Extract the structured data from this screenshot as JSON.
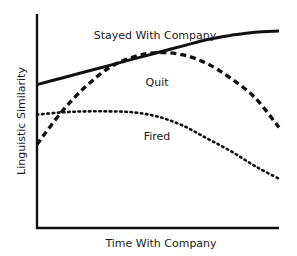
{
  "chart_data": {
    "type": "line",
    "title": "",
    "xlabel": "Time With Company",
    "ylabel": "Linguistic Similarity",
    "x_ticks": [],
    "y_ticks": [],
    "grid": false,
    "legend": "inline labels",
    "xlim": [
      0,
      1
    ],
    "ylim": [
      0,
      1
    ],
    "x": [
      0,
      0.1,
      0.2,
      0.3,
      0.4,
      0.5,
      0.6,
      0.7,
      0.8,
      0.9,
      1.0
    ],
    "series": [
      {
        "name": "Stayed With Company",
        "style": "solid",
        "color": "#111111",
        "values": [
          0.67,
          0.7,
          0.73,
          0.76,
          0.79,
          0.82,
          0.85,
          0.88,
          0.9,
          0.915,
          0.92
        ],
        "label_pos": [
          0.43,
          0.92
        ]
      },
      {
        "name": "Quit",
        "style": "dashed",
        "color": "#111111",
        "values": [
          0.39,
          0.54,
          0.66,
          0.75,
          0.8,
          0.82,
          0.81,
          0.77,
          0.7,
          0.61,
          0.47
        ],
        "label_pos": [
          0.54,
          0.7
        ]
      },
      {
        "name": "Fired",
        "style": "dotted",
        "color": "#111111",
        "values": [
          0.53,
          0.54,
          0.545,
          0.545,
          0.54,
          0.52,
          0.48,
          0.42,
          0.36,
          0.29,
          0.23
        ],
        "label_pos": [
          0.56,
          0.42
        ]
      }
    ]
  },
  "axes": {
    "xlabel": "Time With Company",
    "ylabel": "Linguistic Similarity"
  },
  "labels": {
    "stayed": "Stayed With Company",
    "quit": "Quit",
    "fired": "Fired"
  }
}
